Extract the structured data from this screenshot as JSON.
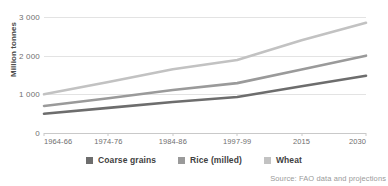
{
  "chart_data": {
    "type": "line",
    "title": "",
    "xlabel": "",
    "ylabel": "Million tonnes",
    "ylim": [
      0,
      3000
    ],
    "yticks": [
      0,
      1000,
      2000,
      3000
    ],
    "ytick_labels": [
      "0",
      "1 000",
      "2 000",
      "3 000"
    ],
    "grid": true,
    "legend_position": "bottom-center",
    "categories": [
      "1964-66",
      "1974-76",
      "1984-86",
      "1997-99",
      "2015",
      "2030"
    ],
    "series": [
      {
        "name": "Coarse grains",
        "color": "#6d6d6d",
        "values": [
          500,
          650,
          800,
          930,
          1210,
          1480
        ]
      },
      {
        "name": "Rice (milled)",
        "color": "#9a9a9a",
        "values": [
          700,
          900,
          1110,
          1290,
          1640,
          2000
        ]
      },
      {
        "name": "Wheat",
        "color": "#c2c2c2",
        "values": [
          1000,
          1320,
          1650,
          1890,
          2400,
          2850
        ]
      }
    ],
    "source_note": "Source: FAO data and projections"
  },
  "axis": {
    "y_title": "Million tonnes"
  },
  "source": {
    "text": "Source: FAO data and projections"
  },
  "colors": {
    "grid": "#e3e3e3",
    "axis": "#c9c9c9",
    "tick_text": "#6f6f6f",
    "legend_text": "#3f3f3f",
    "source_text": "#9a9a9a",
    "background": "#ffffff"
  }
}
